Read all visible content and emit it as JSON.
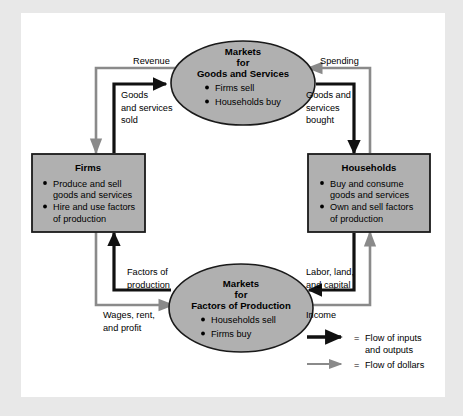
{
  "diagram": {
    "colors": {
      "page_background": "#e8e8e8",
      "frame_background": "#ffffff",
      "node_fill": "#b0b0b0",
      "node_stroke": "#1a1a1a",
      "flow_goods_color": "#111111",
      "flow_dollars_color": "#8a8a8a"
    },
    "nodes": [
      {
        "id": "markets-goods-services",
        "shape": "ellipse",
        "title_lines": [
          "Markets",
          "for",
          "Goods and Services"
        ],
        "items": [
          "Firms sell",
          "Households buy"
        ]
      },
      {
        "id": "firms",
        "shape": "rect",
        "title_lines": [
          "Firms"
        ],
        "items": [
          "Produce and sell goods and services",
          "Hire and use factors of production"
        ],
        "item_lines": [
          [
            "Produce and sell",
            "goods and services"
          ],
          [
            "Hire and use factors",
            "of production"
          ]
        ]
      },
      {
        "id": "households",
        "shape": "rect",
        "title_lines": [
          "Households"
        ],
        "items": [
          "Buy and consume goods and services",
          "Own and sell factors of production"
        ],
        "item_lines": [
          [
            "Buy and consume",
            "goods and services"
          ],
          [
            "Own and sell factors",
            "of production"
          ]
        ]
      },
      {
        "id": "markets-factors-production",
        "shape": "ellipse",
        "title_lines": [
          "Markets",
          "for",
          "Factors of Production"
        ],
        "items": [
          "Households sell",
          "Firms buy"
        ]
      }
    ],
    "flow_labels": {
      "revenue": "Revenue",
      "goods_services_sold": [
        "Goods",
        "and services",
        "sold"
      ],
      "spending": "Spending",
      "goods_services_bought": [
        "Goods and",
        "services",
        "bought"
      ],
      "factors_of_production": [
        "Factors of",
        "production"
      ],
      "wages_rent_profit": [
        "Wages, rent,",
        "and profit"
      ],
      "labor_land_capital": [
        "Labor, land,",
        "and capital"
      ],
      "income": "Income"
    },
    "legend": {
      "entries": [
        {
          "type": "inputs-outputs",
          "equals": "=",
          "label_lines": [
            "Flow of inputs",
            "and outputs"
          ],
          "color": "#111111"
        },
        {
          "type": "dollars",
          "equals": "=",
          "label_lines": [
            "Flow of dollars"
          ],
          "color": "#8a8a8a"
        }
      ]
    }
  }
}
